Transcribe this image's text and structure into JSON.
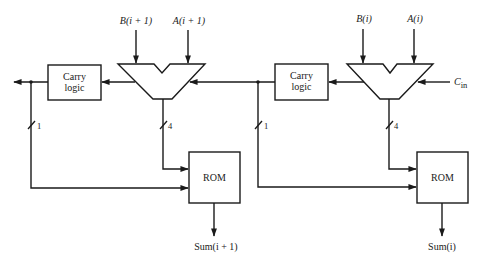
{
  "diagram": {
    "title": "",
    "stages": [
      {
        "name": "stage-i-plus-1",
        "inputs": {
          "b_label": "B(i + 1)",
          "a_label": "A(i + 1)"
        },
        "carry_logic": {
          "line1": "Carry",
          "line2": "logic"
        },
        "rom": {
          "label": "ROM"
        },
        "bus_widths": {
          "carry_bits": "1",
          "alu_bits": "4"
        },
        "output_label": "Sum(i + 1)"
      },
      {
        "name": "stage-i",
        "inputs": {
          "b_label": "B(i)",
          "a_label": "A(i)",
          "cin_label": "C",
          "cin_sub": "in"
        },
        "carry_logic": {
          "line1": "Carry",
          "line2": "logic"
        },
        "rom": {
          "label": "ROM"
        },
        "bus_widths": {
          "carry_bits": "1",
          "alu_bits": "4"
        },
        "output_label": "Sum(i)"
      }
    ],
    "colors": {
      "ink": "#1a1a1a",
      "background": "#ffffff"
    }
  }
}
